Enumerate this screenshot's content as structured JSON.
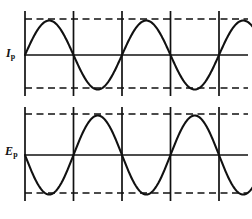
{
  "figure": {
    "background_color": "#ffffff",
    "line_color": "#111111",
    "width": 252,
    "height": 219
  },
  "labels": {
    "top": {
      "base": "I",
      "sub": "p",
      "meaning": "primary current"
    },
    "bottom": {
      "base": "E",
      "sub": "p",
      "meaning": "primary voltage"
    }
  },
  "chart_data": [
    {
      "type": "line",
      "name": "Ip",
      "title": "",
      "xlabel": "",
      "ylabel": "I_p",
      "series": [
        {
          "name": "I_p",
          "waveform": "sine",
          "phase_deg": 0,
          "amplitude": 1,
          "periods": 2.5,
          "values": [
            0,
            0.707,
            1,
            0.707,
            0,
            -0.707,
            -1,
            -0.707,
            0,
            0.707,
            1,
            0.707,
            0,
            -0.707,
            -1,
            -0.707,
            0,
            0.707,
            1,
            0.707,
            0
          ]
        }
      ],
      "x": [
        0,
        0.125,
        0.25,
        0.375,
        0.5,
        0.625,
        0.75,
        0.875,
        1,
        1.125,
        1.25,
        1.375,
        1.5,
        1.625,
        1.75,
        1.875,
        2,
        2.125,
        2.25,
        2.375,
        2.5
      ],
      "ylim": [
        -1.15,
        1.15
      ],
      "xlim": [
        0,
        2.5
      ],
      "grid": true,
      "gridlines_x": [
        0,
        0.5,
        1.0,
        1.5,
        2.0
      ],
      "gridlines_y": [
        1,
        -1
      ],
      "gridline_style": "dashed-horizontal-solid-vertical",
      "zero_axis": true,
      "legend": "none"
    },
    {
      "type": "line",
      "name": "Ep",
      "title": "",
      "xlabel": "",
      "ylabel": "E_p",
      "series": [
        {
          "name": "E_p",
          "waveform": "sine",
          "phase_deg": 180,
          "amplitude": 1,
          "periods": 2.5,
          "values": [
            0,
            -0.707,
            -1,
            -0.707,
            0,
            0.707,
            1,
            0.707,
            0,
            -0.707,
            -1,
            -0.707,
            0,
            0.707,
            1,
            0.707,
            0,
            -0.707,
            -1,
            -0.707,
            0
          ]
        }
      ],
      "x": [
        0,
        0.125,
        0.25,
        0.375,
        0.5,
        0.625,
        0.75,
        0.875,
        1,
        1.125,
        1.25,
        1.375,
        1.5,
        1.625,
        1.75,
        1.875,
        2,
        2.125,
        2.25,
        2.375,
        2.5
      ],
      "ylim": [
        -1.15,
        1.15
      ],
      "xlim": [
        0,
        2.5
      ],
      "grid": true,
      "gridlines_x": [
        0,
        0.5,
        1.0,
        1.5,
        2.0
      ],
      "gridlines_y": [
        1,
        -1
      ],
      "gridline_style": "dashed-horizontal-solid-vertical",
      "zero_axis": true,
      "legend": "none"
    }
  ]
}
